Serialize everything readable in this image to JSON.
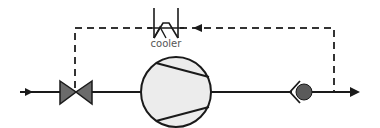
{
  "diagram": {
    "type": "refrigeration-compressor-schematic",
    "components": {
      "cooler": {
        "label": "cooler"
      },
      "expansion_valve": {
        "label": ""
      },
      "compressor": {
        "label": ""
      },
      "check_valve": {
        "label": ""
      }
    },
    "lines": {
      "main_flow": "solid",
      "bypass_flow": "dashed"
    },
    "colors": {
      "stroke": "#1a1a1a",
      "valve_fill": "#6b6b6b",
      "compressor_fill": "#ececec",
      "check_ball_fill": "#5a5a5a",
      "dash": "#333333",
      "label": "#555555"
    }
  }
}
